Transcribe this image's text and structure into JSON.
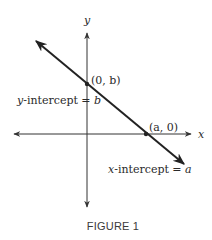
{
  "figure": {
    "caption": "FIGURE 1",
    "axes": {
      "x_label": "x",
      "y_label": "y"
    },
    "points": {
      "y_intercept_point": "(0, b)",
      "x_intercept_point": "(a, 0)"
    },
    "annotations": {
      "y_intercept_prefix": "y",
      "y_intercept_rest": "-intercept = ",
      "y_intercept_var": "b",
      "x_intercept_prefix": "x",
      "x_intercept_rest": "-intercept = ",
      "x_intercept_var": "a"
    },
    "colors": {
      "line": "#222222",
      "axis": "#333333",
      "text": "#2a2a2a"
    }
  }
}
